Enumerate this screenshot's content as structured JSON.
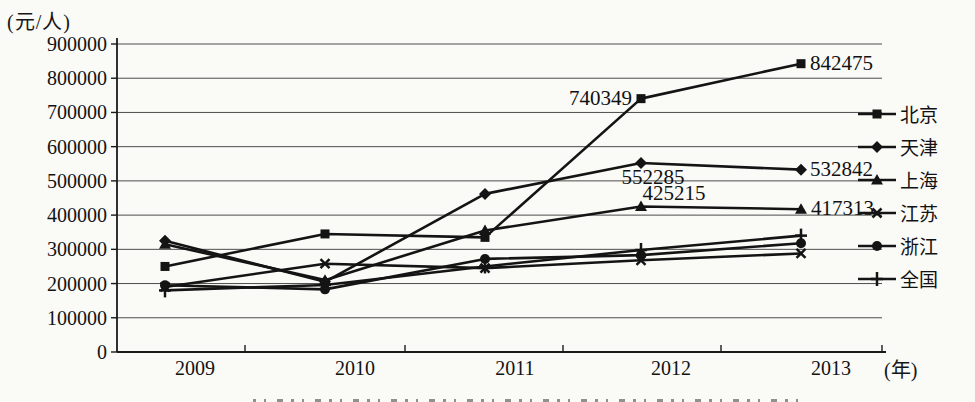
{
  "chart_data": {
    "type": "line",
    "title": "",
    "ylabel": "(元/人)",
    "xaxis_unit": "(年)",
    "categories": [
      "2009",
      "2010",
      "2011",
      "2012",
      "2013"
    ],
    "ylim": [
      0,
      900000
    ],
    "ytick_step": 100000,
    "grid": true,
    "legend_position": "right",
    "line_color": "#141414",
    "background": "#fafaf7",
    "series": [
      {
        "key": "beijing",
        "name": "北京",
        "marker": "square",
        "values": [
          250000,
          345000,
          335000,
          740349,
          842475
        ]
      },
      {
        "key": "tianjin",
        "name": "天津",
        "marker": "diamond",
        "values": [
          325000,
          205000,
          462000,
          552285,
          532842
        ]
      },
      {
        "key": "shanghai",
        "name": "上海",
        "marker": "triangle",
        "values": [
          315000,
          210000,
          355000,
          425215,
          417313
        ]
      },
      {
        "key": "jiangsu",
        "name": "江苏",
        "marker": "x",
        "values": [
          190000,
          258000,
          245000,
          268000,
          288000
        ]
      },
      {
        "key": "zhejiang",
        "name": "浙江",
        "marker": "circle",
        "values": [
          195000,
          183000,
          272000,
          283000,
          318000
        ]
      },
      {
        "key": "quanguo",
        "name": "全国",
        "marker": "plus",
        "values": [
          180000,
          196000,
          250000,
          298000,
          340000
        ]
      }
    ],
    "point_labels": [
      {
        "series": "beijing",
        "index": 3,
        "text": "740349",
        "anchor": "end",
        "dx": -9,
        "dy": 6
      },
      {
        "series": "beijing",
        "index": 4,
        "text": "842475",
        "anchor": "start",
        "dx": 9,
        "dy": 6
      },
      {
        "series": "tianjin",
        "index": 3,
        "text": "552285",
        "anchor": "middle",
        "dx": 12,
        "dy": 21
      },
      {
        "series": "tianjin",
        "index": 4,
        "text": "532842",
        "anchor": "start",
        "dx": 9,
        "dy": 6
      },
      {
        "series": "shanghai",
        "index": 3,
        "text": "425215",
        "anchor": "middle",
        "dx": 33,
        "dy": -6
      },
      {
        "series": "shanghai",
        "index": 4,
        "text": "417313",
        "anchor": "start",
        "dx": 10,
        "dy": 6
      }
    ]
  }
}
